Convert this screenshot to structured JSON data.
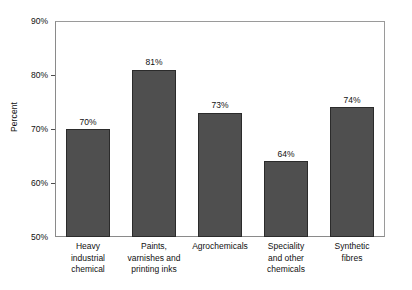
{
  "chart_data": {
    "type": "bar",
    "title": "",
    "subtitle": "",
    "xlabel": "",
    "ylabel": "Percent",
    "ylim": [
      50,
      90
    ],
    "ytick_labels": [
      "90%",
      "80%",
      "70%",
      "60%",
      "50%"
    ],
    "ytick_values": [
      90,
      80,
      70,
      60,
      50
    ],
    "grid": false,
    "legend": "none",
    "categories": [
      "Heavy industrial chemical",
      "Paints, varnishes and printing inks",
      "Agrochemicals",
      "Speciality and other chemicals",
      "Synthetic fibres"
    ],
    "category_lines": [
      [
        "Heavy",
        "industrial",
        "chemical"
      ],
      [
        "Paints,",
        "varnishes and",
        "printing inks"
      ],
      [
        "Agrochemicals"
      ],
      [
        "Speciality",
        "and other",
        "chemicals"
      ],
      [
        "Synthetic",
        "fibres"
      ]
    ],
    "values": [
      70,
      81,
      73,
      64,
      74
    ],
    "value_labels": [
      "70%",
      "81%",
      "73%",
      "64%",
      "74%"
    ],
    "bar_color": "#4f4f4f",
    "bar_border_color": "#2b2b2b",
    "axis_color": "#8a8a8a",
    "background_color": "#ffffff"
  }
}
